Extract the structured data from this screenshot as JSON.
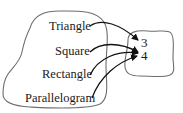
{
  "diagram": {
    "type": "function-mapping",
    "domain_set": {
      "name": "shapes",
      "items": [
        "Triangle",
        "Square",
        "Rectangle",
        "Parallelogram"
      ]
    },
    "codomain_set": {
      "name": "numbers",
      "items": [
        "3",
        "4"
      ]
    },
    "mappings": [
      {
        "from": "Triangle",
        "to": "3"
      },
      {
        "from": "Square",
        "to": "4"
      },
      {
        "from": "Rectangle",
        "to": "4"
      },
      {
        "from": "Parallelogram",
        "to": "4"
      }
    ],
    "colors": {
      "blob_stroke": "#6e6e6e",
      "arrow": "#111111",
      "text": "#1a1a1a"
    }
  }
}
